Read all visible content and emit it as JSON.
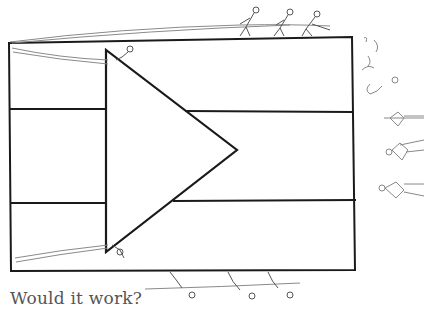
{
  "caption": "Would it work?",
  "colors": {
    "ink": "#1a1a1a",
    "pencil": "#8a8a8a",
    "caption": "#555555",
    "background": "#ffffff"
  },
  "drawing": {
    "subject": "flag-like rectangle with three horizontal bands and a triangle on the left side, pulled by stick figures with ropes",
    "bands": 3,
    "figures_top": 3,
    "figures_bottom": 3,
    "figures_right": 4
  }
}
